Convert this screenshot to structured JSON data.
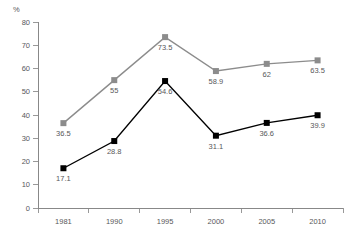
{
  "chart_data": {
    "type": "line",
    "title": "",
    "xlabel": "",
    "ylabel": "%",
    "unit_label": "%",
    "categories": [
      "1981",
      "1990",
      "1995",
      "2000",
      "2005",
      "2010"
    ],
    "ylim": [
      0,
      80
    ],
    "ytick_step": 10,
    "yticks": [
      "0",
      "10",
      "20",
      "30",
      "40",
      "50",
      "60",
      "70",
      "80"
    ],
    "grid": false,
    "legend": "none",
    "series": [
      {
        "name": "gray-series",
        "color": "#8c8c8c",
        "marker": "square",
        "values": [
          36.5,
          55,
          73.5,
          58.9,
          62,
          63.5
        ],
        "labels": [
          "36.5",
          "55",
          "73.5",
          "58.9",
          "62",
          "63.5"
        ]
      },
      {
        "name": "black-series",
        "color": "#000000",
        "marker": "square",
        "values": [
          17.1,
          28.8,
          54.6,
          31.1,
          36.6,
          39.9
        ],
        "labels": [
          "17.1",
          "28.8",
          "54.6",
          "31.1",
          "36.6",
          "39.9"
        ]
      }
    ]
  }
}
